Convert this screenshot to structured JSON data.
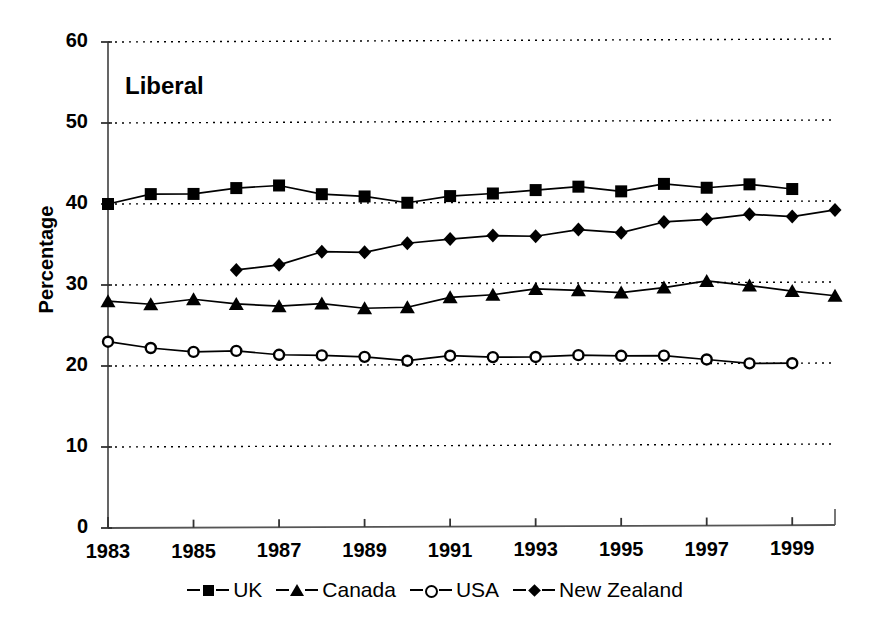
{
  "chart_data": {
    "type": "line",
    "title": "Liberal",
    "xlabel": "",
    "ylabel": "Percentage",
    "ylim": [
      0,
      60
    ],
    "ytick_step": 10,
    "yticks": [
      "0",
      "10",
      "20",
      "30",
      "40",
      "50",
      "60"
    ],
    "xlim": [
      1983,
      2000
    ],
    "xticks": [
      "1983",
      "1985",
      "1987",
      "1989",
      "1991",
      "1993",
      "1995",
      "1997",
      "1999"
    ],
    "xtick_values": [
      1983,
      1985,
      1987,
      1989,
      1991,
      1993,
      1995,
      1997,
      1999
    ],
    "grid": "horizontal-dotted",
    "legend_position": "below-axis",
    "line_color": "#000000",
    "series": [
      {
        "name": "UK",
        "marker": "filled-square",
        "x": [
          1983,
          1984,
          1985,
          1986,
          1987,
          1988,
          1989,
          1990,
          1991,
          1992,
          1993,
          1994,
          1995,
          1996,
          1997,
          1998,
          1999
        ],
        "values": [
          40.0,
          41.2,
          41.2,
          41.9,
          42.2,
          41.1,
          40.8,
          40.0,
          40.8,
          41.1,
          41.5,
          41.9,
          41.3,
          42.2,
          41.7,
          42.1,
          41.5
        ]
      },
      {
        "name": "Canada",
        "marker": "filled-triangle",
        "x": [
          1983,
          1984,
          1985,
          1986,
          1987,
          1988,
          1989,
          1990,
          1991,
          1992,
          1993,
          1994,
          1995,
          1996,
          1997,
          1998,
          1999,
          2000
        ],
        "values": [
          28.0,
          27.6,
          28.2,
          27.6,
          27.3,
          27.6,
          27.0,
          27.1,
          28.3,
          28.6,
          29.3,
          29.1,
          28.8,
          29.4,
          30.2,
          29.6,
          28.9,
          28.3
        ]
      },
      {
        "name": "USA",
        "marker": "open-circle",
        "x": [
          1983,
          1984,
          1985,
          1986,
          1987,
          1988,
          1989,
          1990,
          1991,
          1992,
          1993,
          1994,
          1995,
          1996,
          1997,
          1998,
          1999
        ],
        "values": [
          23.0,
          22.2,
          21.7,
          21.8,
          21.3,
          21.2,
          21.0,
          20.5,
          21.1,
          20.9,
          20.9,
          21.1,
          21.0,
          21.0,
          20.5,
          20.0,
          20.0
        ]
      },
      {
        "name": "New Zealand",
        "marker": "filled-diamond",
        "x": [
          1986,
          1987,
          1988,
          1989,
          1990,
          1991,
          1992,
          1993,
          1994,
          1995,
          1996,
          1997,
          1998,
          1999,
          2000
        ],
        "values": [
          31.8,
          32.4,
          34.0,
          33.9,
          35.0,
          35.5,
          35.9,
          35.8,
          36.6,
          36.2,
          37.5,
          37.8,
          38.4,
          38.1,
          38.9
        ]
      }
    ]
  },
  "legend": {
    "entries": [
      {
        "label": "UK",
        "marker": "filled-square"
      },
      {
        "label": "Canada",
        "marker": "filled-triangle"
      },
      {
        "label": "USA",
        "marker": "open-circle"
      },
      {
        "label": "New Zealand",
        "marker": "filled-diamond"
      }
    ]
  }
}
